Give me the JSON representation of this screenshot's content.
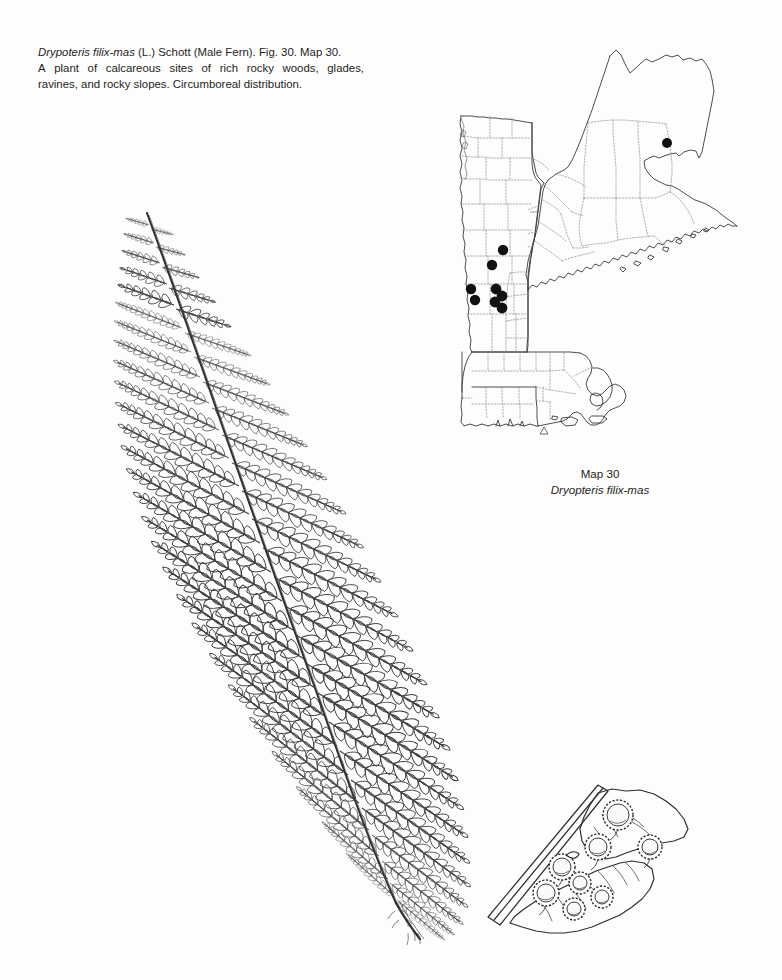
{
  "page": {
    "background": "#fdfdfc",
    "ink": "#1a1a1a"
  },
  "caption": {
    "species_heading": "Drypoteris filix-mas",
    "line1_rest": "(L.) Schott (Male Fern). Fig. 30. Map 30.",
    "line2_words": [
      "A",
      "plant",
      "of",
      "calcareous",
      "sites",
      "of",
      "rich",
      "rocky",
      "woods,",
      "glades,"
    ],
    "line3": "ravines, and rocky slopes. Circumboreal distribution.",
    "figure_number": "Fig. 30",
    "map_number": "Map 30"
  },
  "map": {
    "title": "Map 30",
    "subtitle": "Dryopteris filix-mas",
    "region": "New England",
    "dot_color": "#111111",
    "outline_color": "#3a3a3a",
    "county_color": "#8c8c8c",
    "dot_count": 9,
    "dots": [
      {
        "label": "piscataquis-county-maine",
        "x": 227,
        "y": 97,
        "r": 5.0
      },
      {
        "label": "vermont-north-1",
        "x": 63,
        "y": 204,
        "r": 5.2
      },
      {
        "label": "vermont-north-2",
        "x": 52,
        "y": 219,
        "r": 5.2
      },
      {
        "label": "vermont-west-1",
        "x": 31,
        "y": 243,
        "r": 5.2
      },
      {
        "label": "vermont-west-2",
        "x": 35,
        "y": 254,
        "r": 5.2
      },
      {
        "label": "vermont-cluster-1",
        "x": 56,
        "y": 243,
        "r": 5.4
      },
      {
        "label": "vermont-cluster-2",
        "x": 62,
        "y": 250,
        "r": 5.4
      },
      {
        "label": "vermont-cluster-3",
        "x": 55,
        "y": 256,
        "r": 5.4
      },
      {
        "label": "vermont-cluster-4",
        "x": 62,
        "y": 262,
        "r": 5.4
      }
    ],
    "scale_marker": "triangle"
  },
  "figure": {
    "label": "Fig. 30",
    "parts": [
      {
        "name": "frond",
        "description": "bipinnate-pinnatifid lanceolate frond"
      },
      {
        "name": "rachis",
        "description": "central axis"
      },
      {
        "name": "stipe",
        "description": "scaly stalk at base"
      },
      {
        "name": "sorus-detail",
        "description": "magnified pinnule with reniform indusia"
      }
    ],
    "ink_color": "#2b2b2b"
  },
  "detail": {
    "name": "sorus-detail",
    "sori_count": 8,
    "description": "enlarged pinnule segment bearing sori with kidney-shaped indusia"
  }
}
